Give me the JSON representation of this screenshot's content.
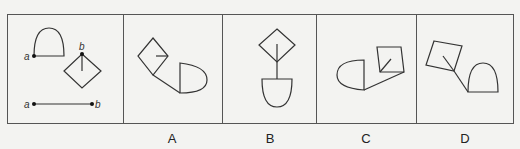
{
  "puzzle": {
    "question_panel": {
      "point_labels": [
        "a",
        "b",
        "a",
        "b"
      ]
    },
    "options": [
      {
        "label": "A"
      },
      {
        "label": "B"
      },
      {
        "label": "C"
      },
      {
        "label": "D"
      }
    ]
  }
}
